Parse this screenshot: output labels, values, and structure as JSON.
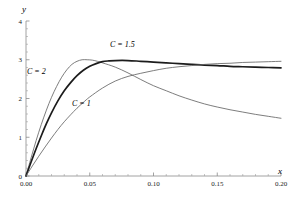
{
  "chart_data": {
    "type": "line",
    "title": "",
    "subtitle": "",
    "xlabel": "x",
    "ylabel": "y",
    "xlim": [
      0.0,
      0.2
    ],
    "ylim": [
      0,
      4
    ],
    "grid": false,
    "legend_position": "inline-annotations",
    "x_ticks": [
      {
        "value": 0.0,
        "label": "0.00"
      },
      {
        "value": 0.05,
        "label": "0.05"
      },
      {
        "value": 0.1,
        "label": "0.10"
      },
      {
        "value": 0.15,
        "label": "0.15"
      },
      {
        "value": 0.2,
        "label": "0.20"
      }
    ],
    "y_ticks": [
      {
        "value": 0,
        "label": "0"
      },
      {
        "value": 1,
        "label": "1"
      },
      {
        "value": 2,
        "label": "2"
      },
      {
        "value": 3,
        "label": "3"
      },
      {
        "value": 4,
        "label": "4"
      }
    ],
    "x_minor_ticks_per_interval": 5,
    "y_minor_ticks_per_interval": 5,
    "annotations": [
      {
        "text": "C = 2",
        "x": 0.012,
        "y": 2.73,
        "series": "C = 2"
      },
      {
        "text": "C = 1.5",
        "x": 0.069,
        "y": 3.42,
        "series": "C = 1.5"
      },
      {
        "text": "C = 1",
        "x": 0.043,
        "y": 1.88,
        "series": "C = 1"
      }
    ],
    "series": [
      {
        "name": "C = 2",
        "style": "thin",
        "color": "#666666",
        "x": [
          0.0,
          0.004,
          0.008,
          0.012,
          0.016,
          0.02,
          0.024,
          0.028,
          0.032,
          0.036,
          0.04,
          0.044,
          0.048,
          0.052,
          0.056,
          0.06,
          0.07,
          0.08,
          0.09,
          0.1,
          0.11,
          0.12,
          0.13,
          0.14,
          0.15,
          0.16,
          0.17,
          0.18,
          0.19,
          0.2
        ],
        "y": [
          0.0,
          0.47,
          0.92,
          1.33,
          1.7,
          2.03,
          2.31,
          2.55,
          2.74,
          2.88,
          2.96,
          3.0,
          3.0,
          2.99,
          2.96,
          2.92,
          2.81,
          2.66,
          2.49,
          2.33,
          2.2,
          2.07,
          1.96,
          1.86,
          1.78,
          1.71,
          1.65,
          1.59,
          1.54,
          1.49
        ]
      },
      {
        "name": "C = 1.5",
        "style": "bold",
        "color": "#1c1c1c",
        "x": [
          0.0,
          0.004,
          0.008,
          0.012,
          0.016,
          0.02,
          0.025,
          0.03,
          0.035,
          0.04,
          0.045,
          0.05,
          0.055,
          0.06,
          0.065,
          0.07,
          0.08,
          0.09,
          0.1,
          0.11,
          0.12,
          0.13,
          0.14,
          0.15,
          0.16,
          0.17,
          0.18,
          0.19,
          0.2
        ],
        "y": [
          0.0,
          0.36,
          0.71,
          1.04,
          1.35,
          1.63,
          1.94,
          2.2,
          2.41,
          2.59,
          2.73,
          2.83,
          2.9,
          2.95,
          2.97,
          2.98,
          2.98,
          2.96,
          2.94,
          2.92,
          2.9,
          2.88,
          2.86,
          2.85,
          2.83,
          2.82,
          2.81,
          2.8,
          2.79
        ]
      },
      {
        "name": "C = 1",
        "style": "thin",
        "color": "#666666",
        "x": [
          0.0,
          0.005,
          0.01,
          0.015,
          0.02,
          0.025,
          0.03,
          0.035,
          0.04,
          0.045,
          0.05,
          0.06,
          0.07,
          0.08,
          0.09,
          0.1,
          0.11,
          0.12,
          0.13,
          0.14,
          0.15,
          0.16,
          0.17,
          0.18,
          0.19,
          0.2
        ],
        "y": [
          0.0,
          0.26,
          0.51,
          0.75,
          0.98,
          1.2,
          1.4,
          1.58,
          1.75,
          1.9,
          2.04,
          2.27,
          2.45,
          2.57,
          2.65,
          2.72,
          2.78,
          2.82,
          2.85,
          2.88,
          2.9,
          2.91,
          2.93,
          2.94,
          2.95,
          2.96
        ]
      }
    ]
  },
  "labels": {
    "y_axis": "y",
    "x_axis": "x",
    "c2": "C = 2",
    "c15": "C = 1.5",
    "c1": "C = 1"
  }
}
